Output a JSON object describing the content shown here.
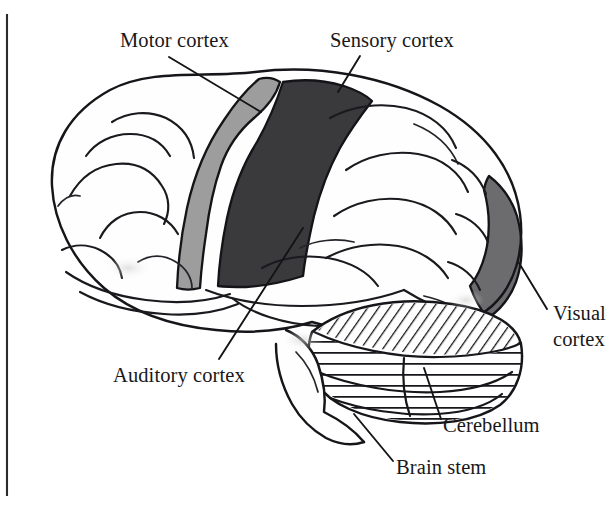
{
  "figure": {
    "kind": "anatomical-line-drawing",
    "background_color": "#ffffff",
    "ink_color": "#16161a",
    "has_plate_border_left": true
  },
  "labels": [
    {
      "id": "motor-cortex",
      "text": "Motor cortex",
      "text_x": 120,
      "text_y": 47,
      "anchor": "start",
      "lines": [
        "Motor cortex"
      ],
      "leader": {
        "x1": 169,
        "y1": 57,
        "x2": 261,
        "y2": 112
      },
      "region_color": "#9d9d9d"
    },
    {
      "id": "sensory-cortex",
      "text": "Sensory cortex",
      "text_x": 330,
      "text_y": 47,
      "anchor": "start",
      "lines": [
        "Sensory cortex"
      ],
      "leader": {
        "x1": 360,
        "y1": 56,
        "x2": 338,
        "y2": 92
      },
      "region_color": "#3a3a3c"
    },
    {
      "id": "visual-cortex",
      "text": "Visual cortex",
      "text_x": 553,
      "text_y": 320,
      "anchor": "start",
      "lines": [
        "Visual",
        "cortex"
      ],
      "leader": {
        "x1": 519,
        "y1": 263,
        "x2": 547,
        "y2": 309
      },
      "region_color": "#6c6c6e"
    },
    {
      "id": "auditory-cortex",
      "text": "Auditory cortex",
      "text_x": 113,
      "text_y": 382,
      "anchor": "start",
      "lines": [
        "Auditory cortex"
      ],
      "leader": {
        "x1": 303,
        "y1": 228,
        "x2": 219,
        "y2": 359
      },
      "region_color": null
    },
    {
      "id": "cerebellum",
      "text": "Cerebellum",
      "text_x": 443,
      "text_y": 432,
      "anchor": "start",
      "lines": [
        "Cerebellum"
      ],
      "leader": {
        "x1": 424,
        "y1": 368,
        "x2": 441,
        "y2": 419
      },
      "region_color": null
    },
    {
      "id": "brain-stem",
      "text": "Brain stem",
      "text_x": 396,
      "text_y": 474,
      "anchor": "start",
      "lines": [
        "Brain stem"
      ],
      "leader": {
        "x1": 354,
        "y1": 414,
        "x2": 393,
        "y2": 461
      },
      "region_color": null
    }
  ],
  "shaded_regions": [
    {
      "name": "motor-cortex-band",
      "shade": "#9d9d9d",
      "description": "medium gray precentral band"
    },
    {
      "name": "sensory-cortex-band",
      "shade": "#3a3a3c",
      "description": "dark near-black postcentral band"
    },
    {
      "name": "visual-cortex-patch",
      "shade": "#6c6c6e",
      "description": "mid gray occipital patch at posterior pole"
    }
  ],
  "textures": [
    {
      "name": "cerebellum-diagonal-hatch",
      "description": "diagonal hatch lines on upper cerebellar lobe"
    },
    {
      "name": "cerebellum-horizontal-striations",
      "description": "horizontal folia lines across cerebellar body"
    }
  ]
}
